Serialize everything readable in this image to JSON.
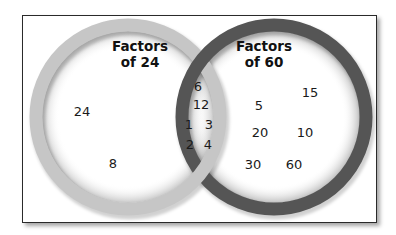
{
  "diagram": {
    "type": "venn",
    "sets": [
      {
        "id": "A",
        "title_line1": "Factors",
        "title_line2": "of 24",
        "ring_color": "#c6c6c6",
        "only": [
          "24",
          "8"
        ]
      },
      {
        "id": "B",
        "title_line1": "Factors",
        "title_line2": "of 60",
        "ring_color": "#555555",
        "only": [
          "15",
          "5",
          "20",
          "10",
          "30",
          "60"
        ]
      }
    ],
    "intersection": [
      "6",
      "12",
      "1",
      "3",
      "2",
      "4"
    ],
    "labels": {
      "a_24": "24",
      "a_8": "8",
      "i_6": "6",
      "i_12": "12",
      "i_1": "1",
      "i_3": "3",
      "i_2": "2",
      "i_4": "4",
      "b_15": "15",
      "b_5": "5",
      "b_20": "20",
      "b_10": "10",
      "b_30": "30",
      "b_60": "60"
    }
  }
}
